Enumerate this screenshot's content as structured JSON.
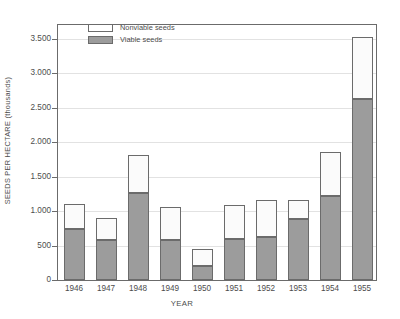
{
  "chart_data": {
    "type": "bar",
    "subtype": "stacked-bar",
    "title": "",
    "xlabel": "YEAR",
    "ylabel": "SEEDS PER HECTARE (thousands)",
    "categories": [
      "1946",
      "1947",
      "1948",
      "1949",
      "1950",
      "1951",
      "1952",
      "1953",
      "1954",
      "1955"
    ],
    "series": [
      {
        "name": "Viable seeds",
        "color": "#9c9c9c",
        "values": [
          740,
          580,
          1265,
          580,
          210,
          600,
          630,
          880,
          1215,
          2620
        ]
      },
      {
        "name": "Nonviable seeds",
        "color": "#ffffff",
        "values": [
          360,
          320,
          555,
          480,
          240,
          485,
          525,
          280,
          645,
          900
        ]
      }
    ],
    "totals": [
      1100,
      900,
      1820,
      1060,
      450,
      1085,
      1155,
      1160,
      1860,
      3520
    ],
    "ylim": [
      0,
      3700
    ],
    "yticks": [
      0,
      500,
      1000,
      1500,
      2000,
      2500,
      3000,
      3500
    ],
    "ytick_labels": [
      "0",
      "500",
      "1.000",
      "1.500",
      "2.000",
      "2.500",
      "3.000",
      "3.500"
    ],
    "grid": "horizontal",
    "legend_position": "top-left-inside",
    "legend": [
      {
        "label": "Nonviable seeds",
        "swatch": "nonviable"
      },
      {
        "label": "Viable seeds",
        "swatch": "viable"
      }
    ]
  }
}
